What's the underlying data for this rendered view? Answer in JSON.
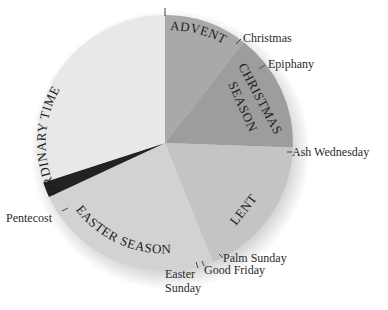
{
  "chart_data": {
    "type": "pie",
    "title": "",
    "center": [
      165,
      143
    ],
    "radius": 128,
    "start_angle_deg": 0,
    "direction": "clockwise",
    "segments": [
      {
        "name": "ADVENT",
        "start": 0,
        "end": 38,
        "color": "#a9a9a9"
      },
      {
        "name": "CHRISTMAS SEASON",
        "start": 38,
        "end": 92,
        "color": "#9d9d9d"
      },
      {
        "name": "LENT",
        "start": 92,
        "end": 158,
        "color": "#c4c4c4"
      },
      {
        "name": "EASTER SEASON",
        "start": 158,
        "end": 245,
        "color": "#d2d2d2"
      },
      {
        "name": "",
        "start": 245,
        "end": 252,
        "color": "#222222"
      },
      {
        "name": "ORDINARY TIME",
        "start": 252,
        "end": 360,
        "color": "#e8e8e8"
      }
    ],
    "annotations": [
      {
        "text": "Christmas",
        "angle": 38
      },
      {
        "text": "Epiphany",
        "angle": 55
      },
      {
        "text": "Ash Wednesday",
        "angle": 92
      },
      {
        "text": "Palm Sunday",
        "angle": 150
      },
      {
        "text": "Good Friday",
        "angle": 156
      },
      {
        "text": "Easter Sunday",
        "angle": 162
      },
      {
        "text": "Pentecost",
        "angle": 245
      }
    ],
    "legend": null
  },
  "labels": {
    "advent": "ADVENT",
    "christmas_season_1": "CHRISTMAS",
    "christmas_season_2": "SEASON",
    "lent": "LENT",
    "easter_season": "EASTER SEASON",
    "ordinary_time": "ORDINARY TIME",
    "christmas": "Christmas",
    "epiphany": "Epiphany",
    "ash_wednesday": "Ash Wednesday",
    "palm_sunday": "Palm Sunday",
    "good_friday": "Good Friday",
    "easter_sunday_1": "Easter",
    "easter_sunday_2": "Sunday",
    "pentecost": "Pentecost"
  }
}
